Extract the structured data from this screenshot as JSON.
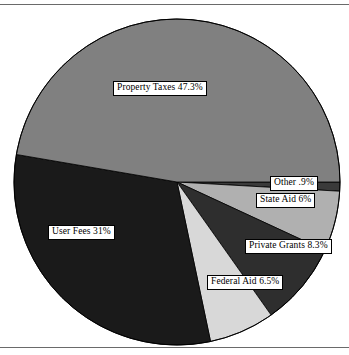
{
  "figure": {
    "name": "revenue-sources-pie-chart",
    "background_color": "#ffffff",
    "rule_color": "#6a6a6a"
  },
  "chart_data": {
    "type": "pie",
    "title": "",
    "xlabel": "",
    "ylabel": "",
    "legend_position": "none",
    "grid": false,
    "total_percent": 100,
    "start_angle_deg": 0,
    "direction": "clockwise",
    "categories": [
      "Other",
      "State Aid",
      "Private Grants",
      "Federal Aid",
      "User Fees",
      "Property Taxes"
    ],
    "values": [
      0.9,
      6,
      8.3,
      6.5,
      31,
      47.3
    ],
    "labels": [
      "Other .9%",
      "State Aid 6%",
      "Private Grants 8.3%",
      "Federal Aid 6.5%",
      "User Fees 31%",
      "Property Taxes 47.3%"
    ],
    "colors": [
      "#3a3a3a",
      "#b0b0b0",
      "#2e2e2e",
      "#d8d8d8",
      "#1a1a1a",
      "#808080"
    ],
    "slices": [
      {
        "name": "other",
        "label": "Other .9%",
        "value": 0.9,
        "color": "#3a3a3a"
      },
      {
        "name": "state-aid",
        "label": "State Aid 6%",
        "value": 6,
        "color": "#b0b0b0"
      },
      {
        "name": "private-grants",
        "label": "Private Grants 8.3%",
        "value": 8.3,
        "color": "#2e2e2e"
      },
      {
        "name": "federal-aid",
        "label": "Federal Aid 6.5%",
        "value": 6.5,
        "color": "#d8d8d8"
      },
      {
        "name": "user-fees",
        "label": "User Fees 31%",
        "value": 31,
        "color": "#1a1a1a"
      },
      {
        "name": "property-taxes",
        "label": "Property Taxes 47.3%",
        "value": 47.3,
        "color": "#808080"
      }
    ]
  }
}
